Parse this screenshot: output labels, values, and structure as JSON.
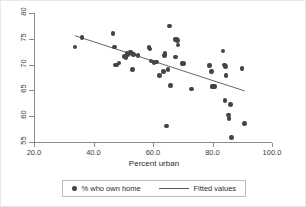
{
  "chart_data": {
    "type": "scatter",
    "title": "",
    "xlabel": "Percent urban",
    "ylabel": "",
    "xlim": [
      20.0,
      100.0
    ],
    "ylim": [
      55,
      80
    ],
    "xticks": [
      "20.0",
      "40.0",
      "60.0",
      "80.0",
      "100.0"
    ],
    "xtick_values": [
      20.0,
      40.0,
      60.0,
      80.0,
      100.0
    ],
    "yticks": [
      "80",
      "75",
      "70",
      "65",
      "60",
      "55"
    ],
    "ytick_values": [
      80,
      75,
      70,
      65,
      60,
      55
    ],
    "grid": false,
    "legend_position": "below",
    "series": [
      {
        "name": "% who own home",
        "type": "scatter",
        "marker": "circle",
        "color": "#444444",
        "points": [
          [
            33.8,
            73.4
          ],
          [
            36.2,
            75.2
          ],
          [
            46.6,
            76.0
          ],
          [
            47.0,
            73.4
          ],
          [
            47.2,
            69.9
          ],
          [
            47.8,
            69.9
          ],
          [
            48.6,
            70.3
          ],
          [
            50.4,
            71.6
          ],
          [
            50.9,
            71.4
          ],
          [
            51.3,
            72.2
          ],
          [
            51.6,
            71.9
          ],
          [
            52.3,
            72.4
          ],
          [
            52.6,
            72.3
          ],
          [
            53.0,
            72.2
          ],
          [
            53.2,
            69.1
          ],
          [
            53.5,
            71.9
          ],
          [
            55.0,
            71.8
          ],
          [
            58.7,
            73.3
          ],
          [
            59.0,
            73.0
          ],
          [
            59.3,
            70.7
          ],
          [
            60.3,
            70.4
          ],
          [
            61.2,
            70.5
          ],
          [
            62.1,
            67.9
          ],
          [
            63.5,
            68.7
          ],
          [
            63.8,
            71.8
          ],
          [
            64.0,
            72.1
          ],
          [
            64.6,
            58.1
          ],
          [
            65.0,
            69.0
          ],
          [
            65.6,
            77.5
          ],
          [
            65.9,
            65.9
          ],
          [
            67.4,
            74.9
          ],
          [
            67.6,
            71.5
          ],
          [
            68.0,
            75.0
          ],
          [
            68.2,
            74.7
          ],
          [
            68.4,
            73.8
          ],
          [
            69.8,
            70.2
          ],
          [
            70.3,
            70.2
          ],
          [
            72.9,
            65.3
          ],
          [
            78.9,
            69.8
          ],
          [
            79.6,
            68.7
          ],
          [
            79.8,
            65.7
          ],
          [
            80.4,
            65.7
          ],
          [
            80.6,
            65.8
          ],
          [
            83.5,
            72.6
          ],
          [
            84.0,
            69.9
          ],
          [
            84.4,
            69.6
          ],
          [
            84.6,
            67.9
          ],
          [
            84.2,
            63.1
          ],
          [
            85.4,
            60.2
          ],
          [
            85.6,
            59.5
          ],
          [
            86.0,
            62.3
          ],
          [
            86.3,
            55.9
          ],
          [
            89.9,
            69.3
          ],
          [
            90.8,
            58.6
          ]
        ]
      },
      {
        "name": "Fitted values",
        "type": "line",
        "color": "#555555",
        "endpoints": [
          [
            33.8,
            75.6
          ],
          [
            90.8,
            64.9
          ]
        ]
      }
    ]
  },
  "axis": {
    "x_title": "Percent urban"
  },
  "legend": {
    "entries": [
      {
        "label": "% who own home",
        "glyph": "marker-dot"
      },
      {
        "label": "Fitted values",
        "glyph": "line-segment"
      }
    ]
  }
}
